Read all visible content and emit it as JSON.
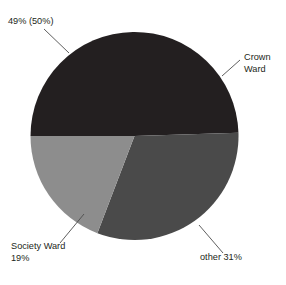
{
  "chart_data": {
    "type": "pie",
    "title": "Ontario Children in Care",
    "categories": [
      "Crown Ward",
      "other",
      "Society Ward"
    ],
    "values": [
      49,
      31,
      19
    ],
    "colors": [
      "#231f20",
      "#4a4a4a",
      "#8d8d8d"
    ],
    "start_angle_deg": 180,
    "direction": "clockwise",
    "legend": "none",
    "grid": false,
    "data_labels": [
      {
        "name": "crown-percent",
        "text": "49%  (50%)",
        "value": 49,
        "secondary_value": 50
      },
      {
        "name": "crown-ward",
        "text": "Crown Ward",
        "line1": "Crown",
        "line2": "Ward"
      },
      {
        "name": "society-ward",
        "text": "Society Ward 19%",
        "line1": "Society Ward",
        "line2": "19%",
        "value": 19
      },
      {
        "name": "other",
        "text": "other 31%",
        "value": 31
      }
    ],
    "annotations": {
      "crown_percent_label": "49%  (50%)",
      "crown_ward_line1": "Crown",
      "crown_ward_line2": "Ward",
      "society_ward_line1": "Society Ward",
      "society_ward_line2": "19%",
      "other_label": "other 31%"
    }
  },
  "geometry": {
    "center_x": 134.5,
    "center_y": 136,
    "radius": 104
  }
}
